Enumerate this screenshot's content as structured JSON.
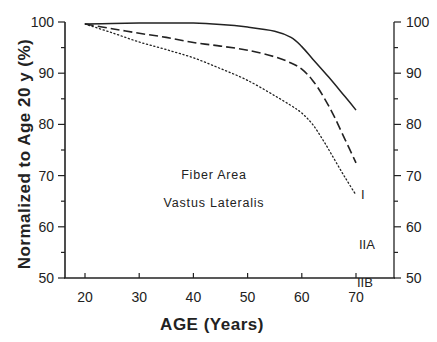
{
  "chart_data": {
    "type": "line",
    "title": "",
    "annotations": [
      "Fiber Area",
      "Vastus Lateralis"
    ],
    "xlabel": "AGE (Years)",
    "ylabel": "Normalized to Age 20 y (%)",
    "xlim": [
      20,
      70
    ],
    "ylim": [
      50,
      100
    ],
    "x_ticks": [
      "20",
      "30",
      "40",
      "50",
      "60",
      "70"
    ],
    "y_ticks": [
      "50",
      "60",
      "70",
      "80",
      "90",
      "100"
    ],
    "y_ticks_right": [
      "50",
      "60",
      "70",
      "80",
      "90",
      "100"
    ],
    "grid": false,
    "legend": "inline labels at line ends",
    "series": [
      {
        "name": "I",
        "style": "solid",
        "x": [
          20,
          25,
          30,
          35,
          40,
          45,
          50,
          55,
          58,
          60,
          62,
          65,
          68,
          70
        ],
        "y": [
          99.6,
          99.7,
          99.8,
          99.8,
          99.8,
          99.5,
          99.0,
          98.2,
          97.0,
          95.2,
          92.8,
          89.2,
          85.4,
          82.8
        ]
      },
      {
        "name": "IIA",
        "style": "dashed",
        "x": [
          20,
          25,
          30,
          35,
          40,
          45,
          50,
          55,
          58,
          60,
          62,
          64,
          66,
          68,
          70
        ],
        "y": [
          99.6,
          98.7,
          97.8,
          97.0,
          96.0,
          95.3,
          94.5,
          93.2,
          92.0,
          90.8,
          88.6,
          85.4,
          81.5,
          77.0,
          72.5
        ]
      },
      {
        "name": "IIB",
        "style": "dotted",
        "x": [
          20,
          25,
          30,
          35,
          40,
          45,
          50,
          55,
          58,
          60,
          62,
          64,
          66,
          68,
          70
        ],
        "y": [
          99.6,
          97.9,
          96.1,
          94.6,
          93.0,
          90.9,
          88.6,
          85.6,
          83.7,
          82.2,
          80.0,
          76.8,
          73.2,
          69.6,
          66.2
        ]
      }
    ]
  },
  "labels": {
    "series": [
      "I",
      "IIA",
      "IIB"
    ]
  }
}
